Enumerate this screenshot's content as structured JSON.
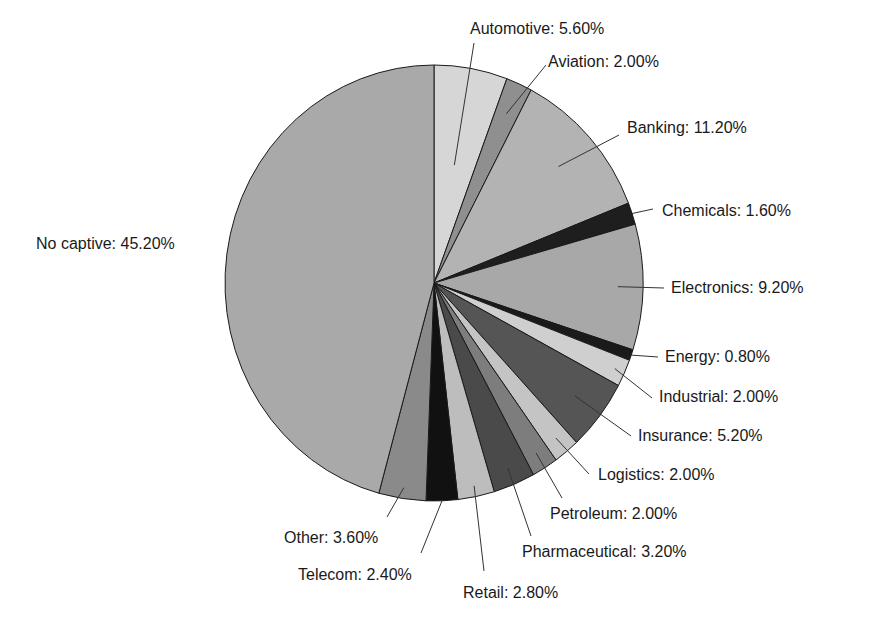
{
  "chart_data": {
    "type": "pie",
    "title": "",
    "start": "top",
    "direction": "clockwise",
    "unit": "%",
    "slices": [
      {
        "label": "Automotive",
        "value": 5.6,
        "display": "Automotive: 5.60%",
        "color": "#d6d6d6"
      },
      {
        "label": "Aviation",
        "value": 2.0,
        "display": "Aviation: 2.00%",
        "color": "#8f8f8f"
      },
      {
        "label": "Banking",
        "value": 11.2,
        "display": "Banking: 11.20%",
        "color": "#b3b3b3"
      },
      {
        "label": "Chemicals",
        "value": 1.6,
        "display": "Chemicals: 1.60%",
        "color": "#1e1e1e"
      },
      {
        "label": "Electronics",
        "value": 9.2,
        "display": "Electronics: 9.20%",
        "color": "#a8a8a8"
      },
      {
        "label": "Energy",
        "value": 0.8,
        "display": "Energy: 0.80%",
        "color": "#1a1a1a"
      },
      {
        "label": "Industrial",
        "value": 2.0,
        "display": "Industrial: 2.00%",
        "color": "#cfcfcf"
      },
      {
        "label": "Insurance",
        "value": 5.2,
        "display": "Insurance: 5.20%",
        "color": "#555555"
      },
      {
        "label": "Logistics",
        "value": 2.0,
        "display": "Logistics: 2.00%",
        "color": "#c4c4c4"
      },
      {
        "label": "Petroleum",
        "value": 2.0,
        "display": "Petroleum: 2.00%",
        "color": "#7d7d7d"
      },
      {
        "label": "Pharmaceutical",
        "value": 3.2,
        "display": "Pharmaceutical: 3.20%",
        "color": "#4a4a4a"
      },
      {
        "label": "Retail",
        "value": 2.8,
        "display": "Retail: 2.80%",
        "color": "#bdbdbd"
      },
      {
        "label": "Telecom",
        "value": 2.4,
        "display": "Telecom: 2.40%",
        "color": "#111111"
      },
      {
        "label": "Other",
        "value": 3.6,
        "display": "Other: 3.60%",
        "color": "#8a8a8a"
      },
      {
        "label": "No captive",
        "value": 45.2,
        "display": "No captive: 45.20%",
        "color": "#a9a9a9"
      }
    ]
  }
}
